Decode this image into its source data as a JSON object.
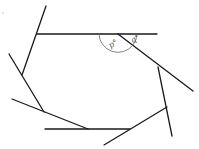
{
  "diagram": {
    "type": "geometry",
    "labels": {
      "interior_angle": "p°",
      "exterior_angle": "q°"
    },
    "colors": {
      "line": "#1a1a1a",
      "arc": "#666666"
    }
  }
}
